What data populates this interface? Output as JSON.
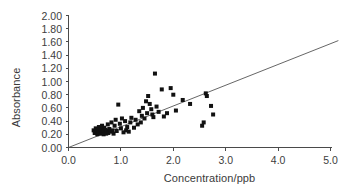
{
  "chart_data": {
    "type": "scatter",
    "title": "",
    "xlabel": "Concentration/ppb",
    "ylabel": "Absorbance",
    "xlim": [
      0.0,
      5.0
    ],
    "ylim": [
      0.0,
      2.0
    ],
    "grid": false,
    "legend": null,
    "x_ticks": [
      "0.0",
      "1.0",
      "2.0",
      "3.0",
      "4.0",
      "5.0"
    ],
    "x_tick_values": [
      0.0,
      1.0,
      2.0,
      3.0,
      4.0,
      5.0
    ],
    "y_ticks": [
      "0.00",
      "0.20",
      "0.40",
      "0.60",
      "0.80",
      "1.00",
      "1.20",
      "1.40",
      "1.60",
      "1.80",
      "2.00"
    ],
    "y_tick_values": [
      0.0,
      0.2,
      0.4,
      0.6,
      0.8,
      1.0,
      1.2,
      1.4,
      1.6,
      1.8,
      2.0
    ],
    "marker": "square",
    "marker_color": "#111111",
    "marker_size_px": 4,
    "series": [
      {
        "name": "Samples",
        "points": [
          [
            0.48,
            0.26
          ],
          [
            0.5,
            0.22
          ],
          [
            0.52,
            0.29
          ],
          [
            0.53,
            0.24
          ],
          [
            0.55,
            0.2
          ],
          [
            0.56,
            0.27
          ],
          [
            0.57,
            0.23
          ],
          [
            0.58,
            0.31
          ],
          [
            0.6,
            0.25
          ],
          [
            0.61,
            0.21
          ],
          [
            0.62,
            0.28
          ],
          [
            0.63,
            0.24
          ],
          [
            0.64,
            0.33
          ],
          [
            0.65,
            0.22
          ],
          [
            0.66,
            0.26
          ],
          [
            0.67,
            0.2
          ],
          [
            0.68,
            0.3
          ],
          [
            0.7,
            0.23
          ],
          [
            0.71,
            0.27
          ],
          [
            0.72,
            0.21
          ],
          [
            0.73,
            0.25
          ],
          [
            0.75,
            0.35
          ],
          [
            0.76,
            0.22
          ],
          [
            0.78,
            0.28
          ],
          [
            0.8,
            0.24
          ],
          [
            0.82,
            0.38
          ],
          [
            0.84,
            0.26
          ],
          [
            0.86,
            0.21
          ],
          [
            0.88,
            0.33
          ],
          [
            0.9,
            0.42
          ],
          [
            0.92,
            0.25
          ],
          [
            0.95,
            0.65
          ],
          [
            0.98,
            0.36
          ],
          [
            1.0,
            0.29
          ],
          [
            1.02,
            0.44
          ],
          [
            1.05,
            0.23
          ],
          [
            1.08,
            0.4
          ],
          [
            1.1,
            0.26
          ],
          [
            1.12,
            0.31
          ],
          [
            1.15,
            0.24
          ],
          [
            1.18,
            0.38
          ],
          [
            1.2,
            0.45
          ],
          [
            1.25,
            0.3
          ],
          [
            1.28,
            0.42
          ],
          [
            1.32,
            0.35
          ],
          [
            1.35,
            0.55
          ],
          [
            1.38,
            0.38
          ],
          [
            1.4,
            0.48
          ],
          [
            1.42,
            0.6
          ],
          [
            1.45,
            0.44
          ],
          [
            1.48,
            0.7
          ],
          [
            1.5,
            0.52
          ],
          [
            1.52,
            0.78
          ],
          [
            1.55,
            0.66
          ],
          [
            1.58,
            0.58
          ],
          [
            1.6,
            0.5
          ],
          [
            1.62,
            0.46
          ],
          [
            1.65,
            1.12
          ],
          [
            1.68,
            0.62
          ],
          [
            1.72,
            0.54
          ],
          [
            1.78,
            0.88
          ],
          [
            1.82,
            0.47
          ],
          [
            1.88,
            0.52
          ],
          [
            1.95,
            0.9
          ],
          [
            2.0,
            0.8
          ],
          [
            2.05,
            0.56
          ],
          [
            2.18,
            0.72
          ],
          [
            2.32,
            0.66
          ],
          [
            2.55,
            0.33
          ],
          [
            2.58,
            0.38
          ],
          [
            2.62,
            0.82
          ],
          [
            2.64,
            0.78
          ],
          [
            2.72,
            0.63
          ],
          [
            2.76,
            0.5
          ]
        ]
      }
    ],
    "annotations": [
      {
        "kind": "trend-line",
        "description": "straight line through the origin",
        "x_start": 0.0,
        "y_start": 0.0,
        "x_end": 5.15,
        "y_end": 1.62,
        "slope": 0.315,
        "intercept": 0.0,
        "color": "#555555"
      }
    ]
  },
  "figure": {
    "background_color": "#ffffff",
    "axis_color": "#4a4a4a",
    "text_color": "#3a3a3a"
  }
}
